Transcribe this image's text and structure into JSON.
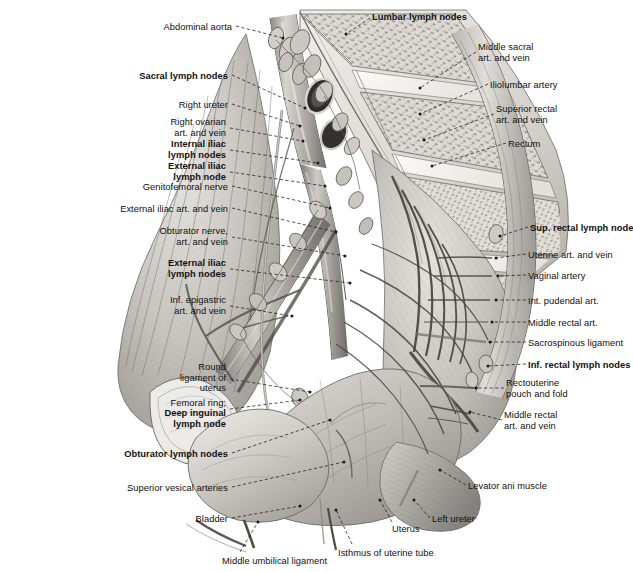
{
  "plate": {
    "title": "Lymph nodes and vessels of the female pelvis",
    "background_color": "#ffffff",
    "ink_color": "#101010",
    "style": "grayscale anatomical engraving"
  },
  "labels_left": [
    {
      "id": "abdominal-aorta",
      "text": "Abdominal aorta",
      "bold": false,
      "x": 232,
      "y": 22,
      "align": "right",
      "leader": "M236,26 L283,38"
    },
    {
      "id": "sacral-lymph-nodes",
      "text": "Sacral lymph nodes",
      "bold": true,
      "x": 228,
      "y": 71,
      "align": "right",
      "leader": "M232,75 L305,108"
    },
    {
      "id": "right-ureter",
      "text": "Right ureter",
      "bold": false,
      "x": 228,
      "y": 100,
      "align": "right",
      "leader": "M232,104 L300,126"
    },
    {
      "id": "right-ovarian-art-vein",
      "text": "Right ovarian\nart. and vein",
      "bold": false,
      "x": 226,
      "y": 117,
      "align": "right",
      "leader": "M230,128 L303,141"
    },
    {
      "id": "internal-iliac-lymph-nodes",
      "text": "Internal iliac\nlymph nodes",
      "bold": true,
      "x": 226,
      "y": 139,
      "align": "right",
      "leader": "M230,150 L318,163"
    },
    {
      "id": "external-iliac-lymph-node",
      "text": "External iliac\nlymph node",
      "bold": true,
      "x": 226,
      "y": 161,
      "align": "right",
      "leader": "M230,172 L325,186"
    },
    {
      "id": "genitofemoral-nerve",
      "text": "Genitofemoral nerve",
      "bold": false,
      "x": 228,
      "y": 182,
      "align": "right",
      "leader": "M232,186 L330,208"
    },
    {
      "id": "external-iliac-art-vein",
      "text": "External iliac art. and vein",
      "bold": false,
      "x": 228,
      "y": 204,
      "align": "right",
      "leader": "M232,208 L336,232"
    },
    {
      "id": "obturator-nerve-art-vein",
      "text": "Obturator nerve,\nart. and vein",
      "bold": false,
      "x": 228,
      "y": 226,
      "align": "right",
      "leader": "M232,237 L345,256"
    },
    {
      "id": "external-iliac-lymph-nodes",
      "text": "External iliac\nlymph nodes",
      "bold": true,
      "x": 226,
      "y": 258,
      "align": "right",
      "leader": "M230,269 L350,283"
    },
    {
      "id": "inf-epigastric-art-vein",
      "text": "Inf. epigastric\nart. and vein",
      "bold": false,
      "x": 226,
      "y": 295,
      "align": "right",
      "leader": "M230,306 L292,316"
    },
    {
      "id": "round-ligament-of-uterus",
      "text": "Round\nligament of\nuterus",
      "bold": false,
      "x": 226,
      "y": 362,
      "align": "right",
      "leader": "M230,379 L310,392"
    },
    {
      "id": "femoral-ring-deep-inguinal",
      "text": "Femoral ring;",
      "bold": false,
      "x": 226,
      "y": 398,
      "align": "right",
      "leader": "M230,409 L300,400"
    },
    {
      "id": "deep-inguinal-lymph-node",
      "text": "Deep inguinal\nlymph node",
      "bold": true,
      "x": 226,
      "y": 408,
      "align": "right",
      "leader": ""
    },
    {
      "id": "obturator-lymph-nodes",
      "text": "Obturator lymph nodes",
      "bold": true,
      "x": 228,
      "y": 449,
      "align": "right",
      "leader": "M232,453 L330,420"
    },
    {
      "id": "superior-vesical-arteries",
      "text": "Superior vesical arteries",
      "bold": false,
      "x": 228,
      "y": 483,
      "align": "right",
      "leader": "M232,487 L344,462"
    },
    {
      "id": "bladder",
      "text": "Bladder",
      "bold": false,
      "x": 228,
      "y": 514,
      "align": "right",
      "leader": "M232,518 L300,506"
    }
  ],
  "labels_top": [
    {
      "id": "lumbar-lymph-nodes",
      "text": "Lumbar lymph nodes",
      "bold": true,
      "x": 372,
      "y": 12,
      "align": "left",
      "leader": "M370,18 L346,34"
    }
  ],
  "labels_right": [
    {
      "id": "middle-sacral-art-vein",
      "text": "Middle sacral\nart. and vein",
      "bold": false,
      "x": 478,
      "y": 42,
      "align": "left",
      "leader": "M476,52 L420,88"
    },
    {
      "id": "iliolumbar-artery",
      "text": "Iliolumbar artery",
      "bold": false,
      "x": 490,
      "y": 80,
      "align": "left",
      "leader": "M488,84 L420,114"
    },
    {
      "id": "superior-rectal-art-vein",
      "text": "Superior rectal\nart. and vein",
      "bold": false,
      "x": 496,
      "y": 104,
      "align": "left",
      "leader": "M494,114 L424,140"
    },
    {
      "id": "rectum",
      "text": "Rectum",
      "bold": false,
      "x": 508,
      "y": 139,
      "align": "left",
      "leader": "M506,143 L432,166"
    },
    {
      "id": "sup-rectal-lymph-node",
      "text": "Sup. rectal lymph node",
      "bold": true,
      "x": 530,
      "y": 223,
      "align": "left",
      "leader": "M528,227 L500,236"
    },
    {
      "id": "uterine-art-and-vein",
      "text": "Uterine art. and vein",
      "bold": false,
      "x": 528,
      "y": 250,
      "align": "left",
      "leader": "M526,254 L496,258"
    },
    {
      "id": "vaginal-artery",
      "text": "Vaginal artery",
      "bold": false,
      "x": 528,
      "y": 271,
      "align": "left",
      "leader": "M526,275 L498,276"
    },
    {
      "id": "int-pudendal-art",
      "text": "Int. pudendal art.",
      "bold": false,
      "x": 528,
      "y": 296,
      "align": "left",
      "leader": "M526,300 L496,300"
    },
    {
      "id": "middle-rectal-art",
      "text": "Middle rectal art.",
      "bold": false,
      "x": 528,
      "y": 318,
      "align": "left",
      "leader": "M526,322 L492,322"
    },
    {
      "id": "sacrospinous-ligament",
      "text": "Sacrospinous ligament",
      "bold": false,
      "x": 528,
      "y": 338,
      "align": "left",
      "leader": "M526,342 L490,342"
    },
    {
      "id": "inf-rectal-lymph-nodes",
      "text": "Inf. rectal lymph nodes",
      "bold": true,
      "x": 528,
      "y": 360,
      "align": "left",
      "leader": "M526,364 L488,366"
    },
    {
      "id": "rectouterine-pouch-and-fold",
      "text": "Rectouterine\npouch and fold",
      "bold": false,
      "x": 506,
      "y": 378,
      "align": "left",
      "leader": "M504,388 L476,388"
    },
    {
      "id": "middle-rectal-art-and-vein",
      "text": "Middle rectal\nart. and vein",
      "bold": false,
      "x": 504,
      "y": 410,
      "align": "left",
      "leader": "M502,420 L470,412"
    },
    {
      "id": "levator-ani-muscle",
      "text": "Levator ani muscle",
      "bold": false,
      "x": 468,
      "y": 481,
      "align": "left",
      "leader": "M466,485 L440,470"
    },
    {
      "id": "left-ureter",
      "text": "Left ureter",
      "bold": false,
      "x": 432,
      "y": 514,
      "align": "left",
      "leader": "M430,518 L414,500"
    }
  ],
  "labels_bottom": [
    {
      "id": "uterus",
      "text": "Uterus",
      "bold": false,
      "x": 392,
      "y": 524,
      "align": "left",
      "leader": "M392,522 L380,500"
    },
    {
      "id": "isthmus-of-uterine-tube",
      "text": "Isthmus of uterine tube",
      "bold": false,
      "x": 338,
      "y": 548,
      "align": "left",
      "leader": "M352,544 L336,510"
    },
    {
      "id": "middle-umbilical-ligament",
      "text": "Middle umbilical ligament",
      "bold": false,
      "x": 222,
      "y": 556,
      "align": "left",
      "leader": "M240,552 L258,522"
    }
  ]
}
